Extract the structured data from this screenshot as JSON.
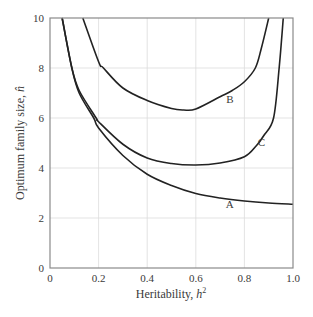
{
  "chart_data": {
    "type": "line",
    "title": "",
    "xlabel": "Heritability, h²",
    "ylabel": "Optimum family size, n̂",
    "xlim": [
      0,
      1.0
    ],
    "ylim": [
      0,
      10
    ],
    "grid": true,
    "x_ticks": [
      "0",
      "0.2",
      "0.4",
      "0.6",
      "0.8",
      "1.0"
    ],
    "y_ticks": [
      "0",
      "2",
      "4",
      "6",
      "8",
      "10"
    ],
    "series": [
      {
        "name": "A",
        "label_pos": [
          0.74,
          2.4
        ],
        "x": [
          0.05,
          0.09,
          0.12,
          0.18,
          0.2,
          0.3,
          0.4,
          0.5,
          0.6,
          0.7,
          0.8,
          0.9,
          1.0
        ],
        "y": [
          10,
          8,
          7,
          6,
          5.6,
          4.5,
          3.75,
          3.3,
          2.98,
          2.8,
          2.68,
          2.6,
          2.55
        ]
      },
      {
        "name": "B",
        "label_pos": [
          0.74,
          6.6
        ],
        "x": [
          0.135,
          0.2,
          0.22,
          0.3,
          0.4,
          0.5,
          0.55,
          0.6,
          0.7,
          0.75,
          0.8,
          0.845,
          0.87,
          0.9
        ],
        "y": [
          10,
          8.25,
          8,
          7.2,
          6.7,
          6.38,
          6.32,
          6.36,
          6.85,
          7.1,
          7.45,
          8,
          8.8,
          10
        ]
      },
      {
        "name": "C",
        "label_pos": [
          0.87,
          4.9
        ],
        "x": [
          0.05,
          0.09,
          0.12,
          0.19,
          0.2,
          0.3,
          0.4,
          0.5,
          0.6,
          0.7,
          0.8,
          0.85,
          0.88,
          0.92,
          0.943,
          0.96
        ],
        "y": [
          10,
          8,
          7.1,
          6,
          5.85,
          4.95,
          4.4,
          4.18,
          4.12,
          4.2,
          4.45,
          4.9,
          5.3,
          6.0,
          8,
          10
        ]
      }
    ]
  },
  "axes": {
    "xlabel_text": "Heritability, ",
    "xlabel_var": "h",
    "xlabel_sup": "2",
    "ylabel_text": "Optimum family size, ",
    "ylabel_var": "n̂"
  }
}
